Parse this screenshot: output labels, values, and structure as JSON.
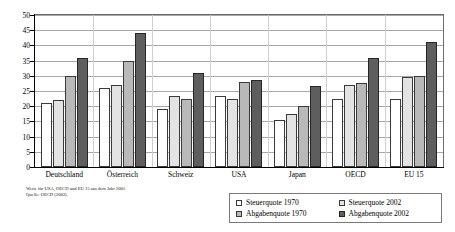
{
  "chart_data": {
    "type": "bar",
    "title": "",
    "xlabel": "",
    "ylabel": "",
    "ylim": [
      0,
      50
    ],
    "ytick_step": 5,
    "yticks": [
      0,
      5,
      10,
      15,
      20,
      25,
      30,
      35,
      40,
      45,
      50
    ],
    "grid": true,
    "legend_position": "bottom-right",
    "categories": [
      "Deutschland",
      "Österreich",
      "Schweiz",
      "USA",
      "Japan",
      "OECD",
      "EU 15"
    ],
    "series": [
      {
        "name": "Steuerquote 1970",
        "key": "s1970",
        "color": "#ffffff",
        "values": [
          21.0,
          26.0,
          19.0,
          23.5,
          15.5,
          22.5,
          22.5
        ]
      },
      {
        "name": "Steuerquote 2002",
        "key": "s2002",
        "color": "#e3e3e3",
        "values": [
          22.0,
          27.0,
          23.5,
          22.5,
          17.5,
          27.0,
          29.5
        ]
      },
      {
        "name": "Abgabenquote 1970",
        "key": "a1970",
        "color": "#b9b9b9",
        "values": [
          30.0,
          35.0,
          22.5,
          28.0,
          20.0,
          27.5,
          30.0
        ]
      },
      {
        "name": "Abgabenquote 2002",
        "key": "a2002",
        "color": "#5e5e5e",
        "values": [
          36.0,
          44.0,
          31.0,
          28.5,
          26.5,
          36.0,
          41.0
        ]
      }
    ]
  },
  "legend": {
    "items": [
      {
        "label": "Steuerquote 1970",
        "key": "s1970"
      },
      {
        "label": "Steuerquote 2002",
        "key": "s2002"
      },
      {
        "label": "Abgabenquote 1970",
        "key": "a1970"
      },
      {
        "label": "Abgabenquote 2002",
        "key": "a2002"
      }
    ]
  },
  "footnote": {
    "line1": "Werte für USA, OECD und EU 15 aus dem Jahr 2001.",
    "line2": "Quelle: OECD (2003)."
  }
}
